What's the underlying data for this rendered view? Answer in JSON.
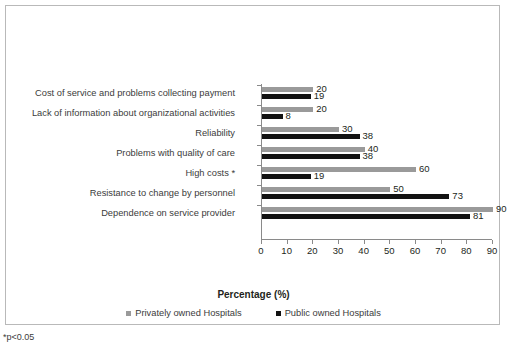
{
  "chart_data": {
    "type": "bar",
    "orientation": "horizontal",
    "title": "",
    "xlabel": "Percentage (%)",
    "ylabel": "",
    "xlim": [
      0,
      90
    ],
    "xticks": [
      0,
      10,
      20,
      30,
      40,
      50,
      60,
      70,
      80,
      90
    ],
    "grid": false,
    "legend_position": "bottom",
    "categories": [
      "Cost of service and problems collecting payment",
      "Lack of information about organizational activities",
      "Reliability",
      "Problems with quality of care",
      "High costs *",
      "Resistance to change by personnel",
      "Dependence on service provider"
    ],
    "series": [
      {
        "name": "Privately owned Hospitals",
        "color": "#9a9a9a",
        "values": [
          20,
          20,
          30,
          40,
          60,
          50,
          90
        ]
      },
      {
        "name": "Public owned Hospitals",
        "color": "#121212",
        "values": [
          19,
          8,
          38,
          38,
          19,
          73,
          81
        ]
      }
    ],
    "annotations": [
      "*p<0.05"
    ]
  },
  "footnote": "*p<0.05"
}
